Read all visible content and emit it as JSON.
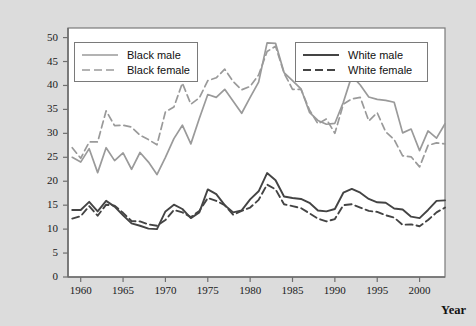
{
  "chart_data": {
    "type": "line",
    "title": "",
    "xlabel": "Year",
    "ylabel": "Unemployment rate (percent)",
    "ylabel_line1": "Unemployment rate",
    "ylabel_line2": "(percent)",
    "xlim": [
      1958.5,
      2003.0
    ],
    "ylim": [
      0,
      52
    ],
    "yticks": [
      0,
      5,
      10,
      15,
      20,
      25,
      30,
      35,
      40,
      45,
      50
    ],
    "ytick_labels": [
      "0",
      "5",
      "10",
      "15",
      "20",
      "25",
      "30",
      "35",
      "40",
      "45",
      "50"
    ],
    "xticks": [
      1960,
      1965,
      1970,
      1975,
      1980,
      1985,
      1990,
      1995,
      2000
    ],
    "xtick_labels": [
      "1960",
      "1965",
      "1970",
      "1975",
      "1980",
      "1985",
      "1990",
      "1995",
      "2000"
    ],
    "grid": false,
    "legend_position": "upper-left and upper-right inside axes",
    "colors": {
      "black_series": "#9a9a9a",
      "white_series": "#444444",
      "frame": "#7a7a7a",
      "background": "#dcdcdc",
      "plot_background": "#ffffff"
    },
    "x": [
      1959,
      1960,
      1961,
      1962,
      1963,
      1964,
      1965,
      1966,
      1967,
      1968,
      1969,
      1970,
      1971,
      1972,
      1973,
      1974,
      1975,
      1976,
      1977,
      1978,
      1979,
      1980,
      1981,
      1982,
      1983,
      1984,
      1985,
      1986,
      1987,
      1988,
      1989,
      1990,
      1991,
      1992,
      1993,
      1994,
      1995,
      1996,
      1997,
      1998,
      1999,
      2000,
      2001,
      2002,
      2003
    ],
    "series": [
      {
        "name": "Black male",
        "style": "solid",
        "color": "#9a9a9a",
        "values": [
          25.0,
          24.0,
          26.8,
          21.8,
          27.0,
          24.3,
          25.9,
          22.5,
          26.0,
          24.0,
          21.4,
          25.0,
          28.9,
          31.7,
          27.8,
          33.1,
          38.1,
          37.5,
          39.2,
          36.7,
          34.2,
          37.5,
          40.7,
          48.9,
          48.8,
          42.7,
          41.0,
          39.3,
          34.4,
          32.7,
          31.9,
          32.1,
          36.5,
          42.0,
          40.1,
          37.6,
          37.1,
          36.9,
          36.5,
          30.1,
          30.9,
          26.4,
          30.5,
          29.0,
          32.0
        ]
      },
      {
        "name": "Black female",
        "style": "dashed",
        "color": "#9a9a9a",
        "values": [
          27.0,
          24.8,
          28.2,
          28.2,
          34.7,
          31.6,
          31.7,
          31.3,
          29.6,
          28.7,
          27.6,
          34.5,
          35.5,
          40.5,
          36.1,
          37.4,
          41.0,
          41.6,
          43.4,
          40.8,
          39.1,
          39.8,
          42.2,
          47.1,
          48.2,
          42.6,
          39.2,
          39.2,
          34.9,
          32.0,
          33.0,
          30.0,
          36.1,
          37.2,
          37.5,
          32.6,
          34.3,
          30.3,
          28.7,
          25.3,
          25.1,
          23.0,
          27.5,
          28.0,
          27.8
        ]
      },
      {
        "name": "White male",
        "style": "solid",
        "color": "#444444",
        "values": [
          14.0,
          14.0,
          15.7,
          13.7,
          15.9,
          14.7,
          12.9,
          11.2,
          10.7,
          10.1,
          10.0,
          13.7,
          15.1,
          14.2,
          12.3,
          13.5,
          18.3,
          17.3,
          15.0,
          13.5,
          13.9,
          16.2,
          17.9,
          21.7,
          20.2,
          16.8,
          16.5,
          16.3,
          15.5,
          13.9,
          13.7,
          14.2,
          17.6,
          18.4,
          17.6,
          16.3,
          15.6,
          15.5,
          14.3,
          14.1,
          12.6,
          12.3,
          14.0,
          15.9,
          16.0
        ]
      },
      {
        "name": "White female",
        "style": "dashed",
        "color": "#444444",
        "values": [
          12.2,
          12.7,
          14.8,
          12.8,
          15.1,
          14.9,
          13.4,
          11.7,
          11.6,
          11.0,
          10.7,
          11.9,
          14.0,
          13.5,
          12.5,
          13.8,
          16.5,
          15.9,
          15.0,
          13.0,
          13.8,
          14.5,
          16.1,
          19.3,
          18.3,
          15.2,
          14.8,
          14.4,
          13.3,
          12.2,
          11.6,
          12.1,
          15.0,
          15.2,
          14.5,
          13.8,
          13.6,
          12.9,
          12.4,
          10.9,
          11.0,
          10.6,
          11.9,
          13.5,
          14.5
        ]
      }
    ]
  },
  "legends": [
    {
      "id": "legend-black",
      "entries": [
        {
          "label": "Black male",
          "style": "solid",
          "color": "#9a9a9a"
        },
        {
          "label": "Black female",
          "style": "dashed",
          "color": "#9a9a9a"
        }
      ]
    },
    {
      "id": "legend-white",
      "entries": [
        {
          "label": "White male",
          "style": "solid",
          "color": "#444444"
        },
        {
          "label": "White female",
          "style": "dashed",
          "color": "#444444"
        }
      ]
    }
  ]
}
